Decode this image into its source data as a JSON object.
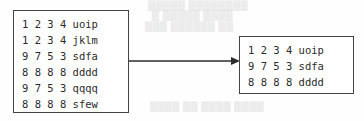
{
  "diagram": {
    "type": "flow",
    "arrow": {
      "name": "flow-arrow",
      "direction": "right",
      "from": "source-box",
      "to": "result-box",
      "color": "#2b2b2b"
    },
    "source_box": {
      "label": "source record list",
      "border_color": "#444444",
      "rows": [
        "1 2 3 4 uoip",
        "1 2 3 4 jklm",
        "9 7 5 3 sdfa",
        "8 8 8 8 dddd",
        "9 7 5 3 qqqq",
        "8 8 8 8 sfew"
      ]
    },
    "result_box": {
      "label": "result record list",
      "border_color": "#444444",
      "rows": [
        "1 2 3 4 uoip",
        "9 7 5 3 sdfa",
        "8 8 8 8 dddd"
      ]
    },
    "background_artifacts": {
      "note": "faint scanned bleed-through text, illegible",
      "lines": [
        "█████ ████████",
        "█ █████ ████",
        "███ ██████ ██",
        "████  ██ ████ ████"
      ]
    }
  }
}
